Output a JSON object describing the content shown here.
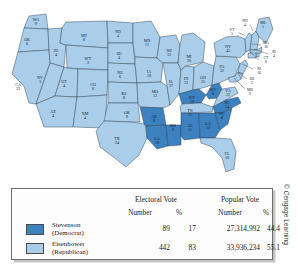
{
  "figure": {
    "kind": "electoral-map",
    "copyright": "© Cengage Learning"
  },
  "colors": {
    "democrat_fill": "#3c81c0",
    "republican_fill": "#aacde9",
    "state_border": "#2b3c4d",
    "nation_border": "#1b2836",
    "water": "#ffffff",
    "label_text": "#15202b"
  },
  "map": {
    "states": [
      {
        "abbr": "WA",
        "votes": "9",
        "party": "republican",
        "lx": 36,
        "ly": 21,
        "leader": null
      },
      {
        "abbr": "OR",
        "votes": "6",
        "party": "republican",
        "lx": 27,
        "ly": 41,
        "leader": null
      },
      {
        "abbr": "CA",
        "votes": "32",
        "party": "republican",
        "lx": 18,
        "ly": 86,
        "leader": null
      },
      {
        "abbr": "ID",
        "votes": "4",
        "party": "republican",
        "lx": 56,
        "ly": 52,
        "leader": null
      },
      {
        "abbr": "NV",
        "votes": "3",
        "party": "republican",
        "lx": 40,
        "ly": 79,
        "leader": null
      },
      {
        "abbr": "MT",
        "votes": "8",
        "party": "republican",
        "lx": 84,
        "ly": 37,
        "leader": null
      },
      {
        "abbr": "WY",
        "votes": "3",
        "party": "republican",
        "lx": 88,
        "ly": 60,
        "leader": null
      },
      {
        "abbr": "UT",
        "votes": "4",
        "party": "republican",
        "lx": 64,
        "ly": 83,
        "leader": null
      },
      {
        "abbr": "AZ",
        "votes": "4",
        "party": "republican",
        "lx": 53,
        "ly": 113,
        "leader": null
      },
      {
        "abbr": "CO",
        "votes": "6",
        "party": "republican",
        "lx": 93,
        "ly": 86,
        "leader": null
      },
      {
        "abbr": "NM",
        "votes": "4",
        "party": "republican",
        "lx": 85,
        "ly": 115,
        "leader": null
      },
      {
        "abbr": "ND",
        "votes": "4",
        "party": "republican",
        "lx": 118,
        "ly": 33,
        "leader": null
      },
      {
        "abbr": "SD",
        "votes": "4",
        "party": "republican",
        "lx": 119,
        "ly": 55,
        "leader": null
      },
      {
        "abbr": "NE",
        "votes": "6",
        "party": "republican",
        "lx": 120,
        "ly": 74,
        "leader": null
      },
      {
        "abbr": "KS",
        "votes": "8",
        "party": "republican",
        "lx": 124,
        "ly": 95,
        "leader": null
      },
      {
        "abbr": "OK",
        "votes": "8",
        "party": "republican",
        "lx": 127,
        "ly": 114,
        "leader": null
      },
      {
        "abbr": "TX",
        "votes": "24",
        "party": "republican",
        "lx": 117,
        "ly": 140,
        "leader": null
      },
      {
        "abbr": "MN",
        "votes": "11",
        "party": "republican",
        "lx": 147,
        "ly": 42,
        "leader": null
      },
      {
        "abbr": "IA",
        "votes": "10",
        "party": "republican",
        "lx": 149,
        "ly": 73,
        "leader": null
      },
      {
        "abbr": "MO",
        "votes": "13",
        "party": "republican",
        "lx": 155,
        "ly": 93,
        "leader": null
      },
      {
        "abbr": "AR",
        "votes": "8",
        "party": "democrat",
        "lx": 154,
        "ly": 118,
        "leader": null
      },
      {
        "abbr": "LA",
        "votes": "10",
        "party": "democrat",
        "lx": 157,
        "ly": 140,
        "leader": null
      },
      {
        "abbr": "WI",
        "votes": "12",
        "party": "republican",
        "lx": 169,
        "ly": 52,
        "leader": null
      },
      {
        "abbr": "IL",
        "votes": "27",
        "party": "republican",
        "lx": 171,
        "ly": 83,
        "leader": null
      },
      {
        "abbr": "MS",
        "votes": "8",
        "party": "democrat",
        "lx": 173,
        "ly": 127,
        "leader": null
      },
      {
        "abbr": "MI",
        "votes": "20",
        "party": "republican",
        "lx": 189,
        "ly": 58,
        "leader": null
      },
      {
        "abbr": "IN",
        "votes": "13",
        "party": "republican",
        "lx": 186,
        "ly": 80,
        "leader": null
      },
      {
        "abbr": "KY",
        "votes": "10",
        "party": "democrat",
        "lx": 192,
        "ly": 99,
        "leader": null
      },
      {
        "abbr": "TN",
        "votes": "11",
        "party": "republican",
        "lx": 190,
        "ly": 112,
        "leader": null
      },
      {
        "abbr": "AL",
        "votes": "11",
        "party": "democrat",
        "lx": 190,
        "ly": 127,
        "leader": null
      },
      {
        "abbr": "OH",
        "votes": "25",
        "party": "republican",
        "lx": 203,
        "ly": 79,
        "leader": null
      },
      {
        "abbr": "GA",
        "votes": "12",
        "party": "democrat",
        "lx": 208,
        "ly": 125,
        "leader": null
      },
      {
        "abbr": "FL",
        "votes": "10",
        "party": "republican",
        "lx": 227,
        "ly": 155,
        "leader": null
      },
      {
        "abbr": "WV",
        "votes": "8",
        "party": "democrat",
        "lx": 213,
        "ly": 91,
        "leader": null
      },
      {
        "abbr": "SC",
        "votes": "8",
        "party": "democrat",
        "lx": 222,
        "ly": 115,
        "leader": null
      },
      {
        "abbr": "NC",
        "votes": "14",
        "party": "democrat",
        "lx": 227,
        "ly": 104,
        "leader": null
      },
      {
        "abbr": "VA",
        "votes": "12",
        "party": "republican",
        "lx": 228,
        "ly": 92,
        "leader": null
      },
      {
        "abbr": "PA",
        "votes": "32",
        "party": "republican",
        "lx": 222,
        "ly": 68,
        "leader": null
      },
      {
        "abbr": "NY",
        "votes": "45",
        "party": "republican",
        "lx": 228,
        "ly": 48,
        "leader": null
      },
      {
        "abbr": "VT",
        "votes": "3",
        "party": "republican",
        "lx": 232,
        "ly": 31,
        "leader": [
          238.5,
          32.5,
          246,
          36
        ]
      },
      {
        "abbr": "NH",
        "votes": "4",
        "party": "republican",
        "lx": 245,
        "ly": 22,
        "leader": [
          250,
          24.5,
          253,
          31
        ]
      },
      {
        "abbr": "ME",
        "votes": "5",
        "party": "republican",
        "lx": 263,
        "ly": 24,
        "leader": null
      },
      {
        "abbr": "MA",
        "votes": "16",
        "party": "republican",
        "lx": 266,
        "ly": 44,
        "leader": [
          261,
          45,
          252,
          44
        ]
      },
      {
        "abbr": "RI",
        "votes": "4",
        "party": "republican",
        "lx": 274,
        "ly": 53,
        "leader": [
          268,
          54,
          254,
          49
        ]
      },
      {
        "abbr": "CT",
        "votes": "8",
        "party": "republican",
        "lx": 266,
        "ly": 59,
        "leader": [
          259,
          60,
          249,
          51
        ]
      },
      {
        "abbr": "NJ",
        "votes": "16",
        "party": "republican",
        "lx": 259,
        "ly": 70,
        "leader": [
          253,
          69,
          242,
          64
        ]
      },
      {
        "abbr": "DE",
        "votes": "3",
        "party": "republican",
        "lx": 252,
        "ly": 80,
        "leader": [
          247,
          79,
          239,
          73
        ]
      },
      {
        "abbr": "MD",
        "votes": "9",
        "party": "republican",
        "lx": 250,
        "ly": 91,
        "leader": [
          245,
          89,
          234,
          78
        ]
      }
    ]
  },
  "legend": {
    "group_headers": [
      {
        "label": "Electoral Vote"
      },
      {
        "label": "Popular Vote"
      }
    ],
    "sub_headers": [
      {
        "label": "Number"
      },
      {
        "label": "%"
      },
      {
        "label": "Number"
      },
      {
        "label": "%"
      }
    ],
    "rows": [
      {
        "candidate": "Stevenson",
        "party": "(Democrat)",
        "swatch_color": "#3c81c0",
        "electoral_number": "89",
        "electoral_pct": "17",
        "popular_number": "27,314,992",
        "popular_pct": "44.4"
      },
      {
        "candidate": "Eisenhower",
        "party": "(Republican)",
        "swatch_color": "#aacde9",
        "electoral_number": "442",
        "electoral_pct": "83",
        "popular_number": "33,936,234",
        "popular_pct": "55.1"
      }
    ]
  },
  "chart_data": {
    "type": "map",
    "title": "",
    "legend_position": "bottom",
    "series": [
      {
        "name": "Stevenson (Democrat)",
        "color": "#3c81c0",
        "electoral_votes": 89,
        "electoral_pct": 17,
        "popular_votes": 27314992,
        "popular_pct": 44.4,
        "states_won": [
          "AR",
          "LA",
          "MS",
          "AL",
          "GA",
          "SC",
          "NC",
          "KY",
          "WV"
        ]
      },
      {
        "name": "Eisenhower (Republican)",
        "color": "#aacde9",
        "electoral_votes": 442,
        "electoral_pct": 83,
        "popular_votes": 33936234,
        "popular_pct": 55.1,
        "states_won": [
          "WA",
          "OR",
          "CA",
          "ID",
          "NV",
          "MT",
          "WY",
          "UT",
          "AZ",
          "CO",
          "NM",
          "ND",
          "SD",
          "NE",
          "KS",
          "OK",
          "TX",
          "MN",
          "IA",
          "MO",
          "WI",
          "IL",
          "MI",
          "IN",
          "TN",
          "OH",
          "FL",
          "VA",
          "PA",
          "NY",
          "VT",
          "NH",
          "ME",
          "MA",
          "RI",
          "CT",
          "NJ",
          "DE",
          "MD"
        ]
      }
    ],
    "state_electoral_votes": {
      "WA": 9,
      "OR": 6,
      "CA": 32,
      "ID": 4,
      "NV": 3,
      "MT": 8,
      "WY": 3,
      "UT": 4,
      "AZ": 4,
      "CO": 6,
      "NM": 4,
      "ND": 4,
      "SD": 4,
      "NE": 6,
      "KS": 8,
      "OK": 8,
      "TX": 24,
      "MN": 11,
      "IA": 10,
      "MO": 13,
      "AR": 8,
      "LA": 10,
      "WI": 12,
      "IL": 27,
      "MS": 8,
      "MI": 20,
      "IN": 13,
      "KY": 10,
      "TN": 11,
      "AL": 11,
      "OH": 25,
      "GA": 12,
      "FL": 10,
      "WV": 8,
      "SC": 8,
      "NC": 14,
      "VA": 12,
      "PA": 32,
      "NY": 45,
      "VT": 3,
      "NH": 4,
      "ME": 5,
      "MA": 16,
      "RI": 4,
      "CT": 8,
      "NJ": 16,
      "DE": 3,
      "MD": 9
    }
  }
}
